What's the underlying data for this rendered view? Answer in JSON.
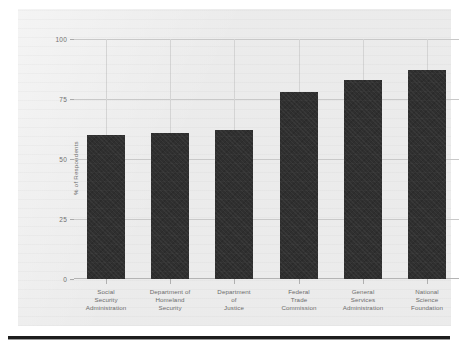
{
  "chart_data": {
    "type": "bar",
    "title": "",
    "xlabel": "",
    "ylabel": "% of Respondents",
    "ylim": [
      0,
      100
    ],
    "yticks": [
      0,
      25,
      50,
      75,
      100
    ],
    "ytick_labels": [
      "0",
      "25",
      "50",
      "75",
      "100"
    ],
    "grid": true,
    "legend": false,
    "bar_color": "#2f2f2f",
    "categories": [
      "Social Security Administration",
      "Department of Homeland Security",
      "Department of Justice",
      "Federal Trade Commission",
      "General Services Administration",
      "National Science Foundation"
    ],
    "category_lines": [
      [
        "Social",
        "Security",
        "Administration"
      ],
      [
        "Department of",
        "Homeland",
        "Security"
      ],
      [
        "Department",
        "of",
        "Justice"
      ],
      [
        "Federal",
        "Trade",
        "Commission"
      ],
      [
        "General",
        "Services",
        "Administration"
      ],
      [
        "National",
        "Science",
        "Foundation"
      ]
    ],
    "values": [
      60,
      61,
      62,
      78,
      83,
      87
    ]
  }
}
